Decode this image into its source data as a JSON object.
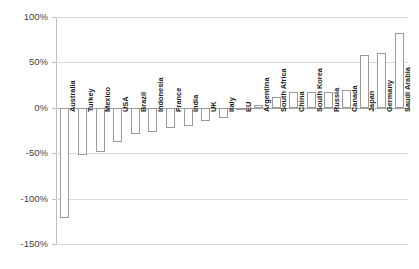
{
  "chart_data": {
    "type": "bar",
    "title": "",
    "subtitle": "",
    "xlabel": "",
    "ylabel": "",
    "ylim": [
      -150,
      100
    ],
    "yticks": [
      100,
      50,
      0,
      -50,
      -100,
      -150
    ],
    "ytick_labels": [
      "100%",
      "50%",
      "0%",
      "-50%",
      "-100%",
      "-150%"
    ],
    "grid": true,
    "legend": "none",
    "series_name": "",
    "categories": [
      "Australia",
      "Turkey",
      "Mexico",
      "USA",
      "Brazil",
      "Indonesia",
      "France",
      "India",
      "UK",
      "Italy",
      "EU",
      "Argentina",
      "South Africa",
      "China",
      "South Korea",
      "Russia",
      "Canada",
      "Japan",
      "Germany",
      "Saudi Arabia"
    ],
    "values": [
      -121,
      -52,
      -49,
      -38,
      -29,
      -27,
      -22,
      -20,
      -14,
      -11,
      -1,
      3,
      12,
      17,
      17,
      17,
      20,
      58,
      60,
      82
    ],
    "bar_fill": "#ffffff",
    "bar_outline": "#9a9a9a",
    "gridline_color": "#d9d9d9",
    "zero_axis_color": "#a6a6a6"
  }
}
